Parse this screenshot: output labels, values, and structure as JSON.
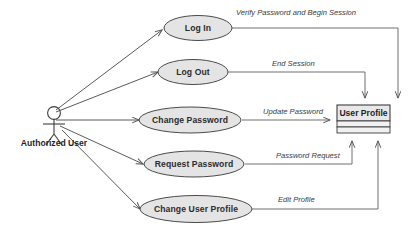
{
  "diagram": {
    "type": "uml-use-case-diagram",
    "actor": {
      "name": "Authorized User",
      "icon": "stick-figure-actor-icon"
    },
    "use_cases": [
      {
        "id": "log-in",
        "label": "Log In"
      },
      {
        "id": "log-out",
        "label": "Log Out"
      },
      {
        "id": "change-password",
        "label": "Change Password"
      },
      {
        "id": "request-password",
        "label": "Request Password"
      },
      {
        "id": "change-user-profile",
        "label": "Change User Profile"
      }
    ],
    "system_entity": {
      "id": "user-profile",
      "label": "User Profile"
    },
    "edge_labels": [
      {
        "id": "verify-password-and-begin-session",
        "label": "Verify Password and Begin Session"
      },
      {
        "id": "end-session",
        "label": "End Session"
      },
      {
        "id": "update-password",
        "label": "Update Password"
      },
      {
        "id": "password-request",
        "label": "Password Request"
      },
      {
        "id": "edit-profile",
        "label": "Edit Profile"
      }
    ],
    "colors": {
      "ellipse_fill": "#e4e4e4",
      "ellipse_stroke": "#4a4a4a",
      "box_fill": "#e8e8e8",
      "connector": "#6e6e6e",
      "text": "#1f1f1f",
      "background": "#ffffff"
    }
  }
}
